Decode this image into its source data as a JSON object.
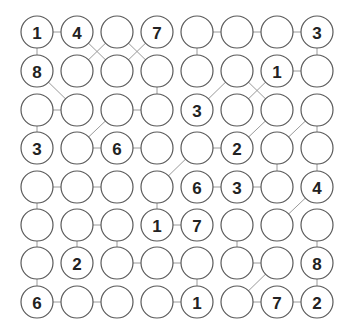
{
  "puzzle": {
    "rows": 8,
    "cols": 8,
    "colors": {
      "circle_stroke": "#5a5a5a",
      "link": "#9a9a9a",
      "text": "#222222",
      "background": "#ffffff"
    },
    "grid": [
      [
        "1",
        "4",
        "",
        "7",
        "",
        "",
        "",
        "3"
      ],
      [
        "8",
        "",
        "",
        "",
        "",
        "",
        "1",
        ""
      ],
      [
        "",
        "",
        "",
        "",
        "3",
        "",
        "",
        ""
      ],
      [
        "3",
        "",
        "6",
        "",
        "",
        "2",
        "",
        ""
      ],
      [
        "",
        "",
        "",
        "",
        "6",
        "3",
        "",
        "4"
      ],
      [
        "",
        "",
        "",
        "1",
        "7",
        "",
        "",
        ""
      ],
      [
        "",
        "2",
        "",
        "",
        "",
        "",
        "",
        "8"
      ],
      [
        "6",
        "",
        "",
        "",
        "1",
        "",
        "7",
        "2"
      ]
    ],
    "links": [
      [
        [
          1,
          1
        ],
        [
          1,
          2
        ]
      ],
      [
        [
          1,
          1
        ],
        [
          2,
          1
        ]
      ],
      [
        [
          1,
          2
        ],
        [
          2,
          3
        ]
      ],
      [
        [
          1,
          3
        ],
        [
          2,
          2
        ]
      ],
      [
        [
          1,
          3
        ],
        [
          2,
          4
        ]
      ],
      [
        [
          1,
          4
        ],
        [
          2,
          3
        ]
      ],
      [
        [
          1,
          5
        ],
        [
          1,
          6
        ]
      ],
      [
        [
          1,
          6
        ],
        [
          1,
          7
        ]
      ],
      [
        [
          1,
          7
        ],
        [
          1,
          8
        ]
      ],
      [
        [
          1,
          5
        ],
        [
          2,
          5
        ]
      ],
      [
        [
          1,
          8
        ],
        [
          2,
          8
        ]
      ],
      [
        [
          2,
          1
        ],
        [
          3,
          2
        ]
      ],
      [
        [
          2,
          4
        ],
        [
          3,
          4
        ]
      ],
      [
        [
          2,
          7
        ],
        [
          2,
          8
        ]
      ],
      [
        [
          2,
          6
        ],
        [
          3,
          5
        ]
      ],
      [
        [
          2,
          6
        ],
        [
          3,
          7
        ]
      ],
      [
        [
          2,
          7
        ],
        [
          3,
          6
        ]
      ],
      [
        [
          3,
          1
        ],
        [
          3,
          2
        ]
      ],
      [
        [
          3,
          3
        ],
        [
          3,
          4
        ]
      ],
      [
        [
          3,
          1
        ],
        [
          4,
          1
        ]
      ],
      [
        [
          3,
          3
        ],
        [
          4,
          2
        ]
      ],
      [
        [
          3,
          7
        ],
        [
          4,
          6
        ]
      ],
      [
        [
          3,
          8
        ],
        [
          4,
          7
        ]
      ],
      [
        [
          3,
          8
        ],
        [
          4,
          8
        ]
      ],
      [
        [
          4,
          2
        ],
        [
          4,
          3
        ]
      ],
      [
        [
          4,
          3
        ],
        [
          4,
          4
        ]
      ],
      [
        [
          4,
          5
        ],
        [
          4,
          6
        ]
      ],
      [
        [
          4,
          5
        ],
        [
          5,
          4
        ]
      ],
      [
        [
          4,
          7
        ],
        [
          5,
          7
        ]
      ],
      [
        [
          4,
          8
        ],
        [
          5,
          8
        ]
      ],
      [
        [
          5,
          1
        ],
        [
          5,
          2
        ]
      ],
      [
        [
          5,
          2
        ],
        [
          5,
          3
        ]
      ],
      [
        [
          5,
          1
        ],
        [
          6,
          1
        ]
      ],
      [
        [
          5,
          4
        ],
        [
          6,
          4
        ]
      ],
      [
        [
          5,
          5
        ],
        [
          5,
          6
        ]
      ],
      [
        [
          5,
          6
        ],
        [
          5,
          7
        ]
      ],
      [
        [
          5,
          8
        ],
        [
          6,
          7
        ]
      ],
      [
        [
          6,
          2
        ],
        [
          6,
          3
        ]
      ],
      [
        [
          6,
          4
        ],
        [
          6,
          5
        ]
      ],
      [
        [
          6,
          1
        ],
        [
          7,
          1
        ]
      ],
      [
        [
          6,
          2
        ],
        [
          7,
          2
        ]
      ],
      [
        [
          6,
          3
        ],
        [
          7,
          3
        ]
      ],
      [
        [
          6,
          6
        ],
        [
          7,
          6
        ]
      ],
      [
        [
          6,
          8
        ],
        [
          7,
          8
        ]
      ],
      [
        [
          7,
          3
        ],
        [
          7,
          4
        ]
      ],
      [
        [
          7,
          4
        ],
        [
          7,
          5
        ]
      ],
      [
        [
          7,
          6
        ],
        [
          7,
          7
        ]
      ],
      [
        [
          7,
          1
        ],
        [
          8,
          1
        ]
      ],
      [
        [
          7,
          5
        ],
        [
          8,
          5
        ]
      ],
      [
        [
          7,
          7
        ],
        [
          8,
          6
        ]
      ],
      [
        [
          7,
          8
        ],
        [
          8,
          8
        ]
      ],
      [
        [
          8,
          1
        ],
        [
          8,
          2
        ]
      ],
      [
        [
          8,
          2
        ],
        [
          8,
          3
        ]
      ],
      [
        [
          8,
          4
        ],
        [
          8,
          5
        ]
      ],
      [
        [
          8,
          6
        ],
        [
          8,
          7
        ]
      ],
      [
        [
          8,
          7
        ],
        [
          8,
          8
        ]
      ]
    ]
  }
}
